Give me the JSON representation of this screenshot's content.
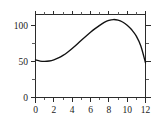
{
  "chart_data": {
    "type": "line",
    "title": "",
    "subtitle": "",
    "xlabel": "",
    "ylabel": "",
    "xlim": [
      0,
      12
    ],
    "ylim": [
      0,
      115
    ],
    "grid": false,
    "legend": null,
    "frame": "box",
    "ticks_all_sides": true,
    "x_tick_labels": [
      "0",
      "2",
      "4",
      "6",
      "8",
      "10",
      "12"
    ],
    "x_major_ticks": [
      0,
      2,
      4,
      6,
      8,
      10,
      12
    ],
    "x_minor_ticks": [
      1,
      3,
      5,
      7,
      9,
      11
    ],
    "y_tick_labels": [
      "0",
      "50",
      "100"
    ],
    "y_major_ticks": [
      0,
      50,
      100
    ],
    "y_minor_ticks": [
      25,
      75
    ],
    "series": [
      {
        "name": "curve",
        "color": "#111111",
        "x": [
          0,
          0.5,
          1,
          1.5,
          2,
          2.5,
          3,
          3.5,
          4,
          4.5,
          5,
          5.5,
          6,
          6.5,
          7,
          7.5,
          8,
          8.5,
          9,
          9.5,
          10,
          10.5,
          11,
          11.5,
          12
        ],
        "y": [
          52,
          50.4,
          50,
          50.6,
          52.2,
          54.8,
          58.4,
          62.8,
          68,
          73.6,
          79.4,
          85,
          90.4,
          95.4,
          100,
          104,
          106.8,
          108,
          107.2,
          104.6,
          100.2,
          93.8,
          85,
          71,
          48
        ]
      }
    ]
  },
  "axes": {
    "x_axis_name": "x-axis",
    "y_axis_name": "y-axis",
    "top_axis_name": "top-axis",
    "right_axis_name": "right-axis"
  }
}
